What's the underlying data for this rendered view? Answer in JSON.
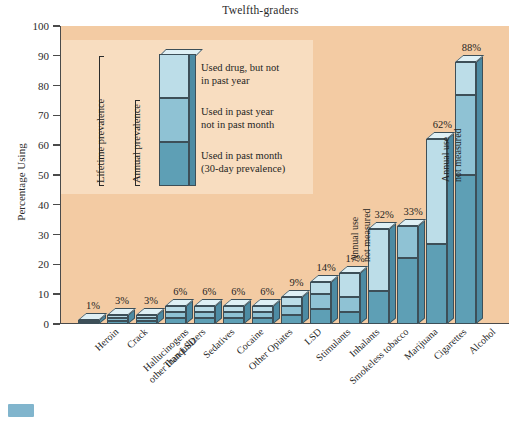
{
  "chart_data": {
    "type": "bar",
    "title": "Twelfth-graders",
    "xlabel": "",
    "ylabel": "Percentage Using",
    "ylim": [
      0,
      100
    ],
    "ytick_step": 10,
    "yticks": [
      100,
      90,
      80,
      70,
      60,
      50,
      40,
      30,
      20,
      10,
      0
    ],
    "grid": false,
    "legend_position": "inside-upper-left",
    "stacked": true,
    "categories": [
      "Heroin",
      "Crack",
      "Hallucinogens other than LSD",
      "Tranquilizers",
      "Sedatives",
      "Cocaine",
      "Other Opiates",
      "LSD",
      "Stimulants",
      "Inhalants",
      "Smokeless tobacco",
      "Marijuana",
      "Cigarettes",
      "Alcohol"
    ],
    "data_labels": [
      "1%",
      "3%",
      "3%",
      "6%",
      "6%",
      "6%",
      "6%",
      "9%",
      "14%",
      "17%",
      "32%",
      "33%",
      "62%",
      "88%"
    ],
    "lifetime_prevalence": [
      1,
      3,
      3,
      6,
      6,
      6,
      6,
      9,
      14,
      17,
      32,
      33,
      62,
      88
    ],
    "series": [
      {
        "name": "Used in past month (30-day prevalence)",
        "color": "#5e9fb5",
        "values": [
          0.5,
          1,
          1,
          2,
          2,
          2,
          2,
          3,
          5,
          4,
          11,
          22,
          27,
          50
        ]
      },
      {
        "name": "Used in past year not in past month",
        "color": "#8fc2d4",
        "values": [
          0.3,
          1,
          1,
          2,
          2,
          2,
          2,
          3,
          5,
          5,
          0,
          11,
          0,
          27
        ]
      },
      {
        "name": "Used drug, but not in past year",
        "color": "#bcdde8",
        "values": [
          0.2,
          1,
          1,
          2,
          2,
          2,
          2,
          3,
          4,
          8,
          21,
          0,
          35,
          11
        ]
      }
    ],
    "annotations": [
      {
        "text_line1": "Annual use",
        "text_line2": "not measured",
        "applies_to": "Smokeless tobacco"
      },
      {
        "text_line1": "Annual use",
        "text_line2": "not measured",
        "applies_to": "Cigarettes"
      }
    ]
  },
  "legend": {
    "brace_lifetime": "Lifetime prevalence",
    "brace_annual": "Annual prevalence",
    "items": [
      {
        "label_line1": "Used drug, but not",
        "label_line2": "in past year",
        "color": "#bcdde8"
      },
      {
        "label_line1": "Used in past year",
        "label_line2": "not in past month",
        "color": "#8fc2d4"
      },
      {
        "label_line1": "Used in past month",
        "label_line2": "(30-day prevalence)",
        "color": "#5e9fb5"
      }
    ]
  },
  "colors": {
    "plot_background": "#f3cba3",
    "page_background": "#ffffff",
    "axis": "#4a4a4a",
    "bar_side": "#4d8ba3",
    "bar_top": "#dff0f5",
    "bar_outline": "#3d4f58"
  },
  "watermark": {
    "label": ""
  }
}
